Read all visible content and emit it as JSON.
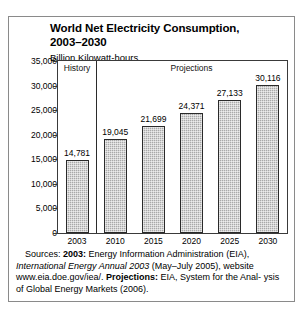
{
  "chart_data": {
    "type": "bar",
    "title": "World Net Electricity Consumption, 2003–2030",
    "subtitle": "Billion Kilowatt-hours",
    "categories": [
      "2003",
      "2010",
      "2015",
      "2020",
      "2025",
      "2030"
    ],
    "values": [
      14781,
      19045,
      21699,
      24371,
      27133,
      30116
    ],
    "value_labels": [
      "14,781",
      "19,045",
      "21,699",
      "24,371",
      "27,133",
      "30,116"
    ],
    "xlabel": "",
    "ylabel": "",
    "ylim": [
      0,
      35000
    ],
    "y_ticks": [
      0,
      5000,
      10000,
      15000,
      20000,
      25000,
      30000,
      35000
    ],
    "y_tick_labels": [
      "0",
      "5,000",
      "10,000",
      "15,000",
      "20,000",
      "25,000",
      "30,000",
      "35,000"
    ],
    "grid": false,
    "legend": "none",
    "sections": [
      {
        "label": "History",
        "categories": [
          "2003"
        ]
      },
      {
        "label": "Projections",
        "categories": [
          "2010",
          "2015",
          "2020",
          "2025",
          "2030"
        ]
      }
    ],
    "bar_fill_color": "#a9a9a9",
    "bar_edge_color": "#2a2a2a"
  },
  "title": {
    "line1": "World Net Electricity Consumption,",
    "line2": "2003–2030",
    "subtitle": "Billion Kilowatt-hours"
  },
  "sections": {
    "history_label": "History",
    "projections_label": "Projections"
  },
  "source_note": {
    "line1_prefix": "Sources: ",
    "line1_bold": "2003:",
    "line1_rest": " Energy Information Administration (EIA),",
    "line2_italic": "International Energy Annual 2003",
    "line2_rest": " (May–July 2005), website",
    "line3_plain": "www.eia.doe.gov/iea/. ",
    "line3_bold": "Projections:",
    "line3_rest": " EIA, System for the Anal-",
    "line4": "ysis of Global Energy Markets (2006)."
  }
}
